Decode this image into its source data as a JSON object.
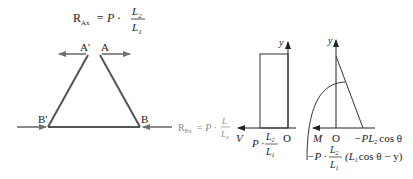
{
  "diagram": {
    "frame": {
      "top_formula": {
        "lhs": "R",
        "lhs_sub": "Ax",
        "eq": "= P ·",
        "num": "L",
        "num_sub": "2",
        "den": "L",
        "den_sub": "1"
      },
      "label_A_prime": "A'",
      "label_A": "A",
      "label_B_prime": "B'",
      "label_B": "B",
      "bottom_formula": {
        "lhs": "R",
        "lhs_sub": "Bx",
        "eq": "= P ·",
        "num": "L",
        "num_sub": "",
        "den": "L",
        "den_sub": "4"
      }
    },
    "shear_plot": {
      "y_axis": "y",
      "x_axis": "V",
      "origin": "O",
      "value_prefix": "P ·",
      "value_num": "L",
      "value_num_sub": "2",
      "value_den": "L",
      "value_den_sub": "1"
    },
    "moment_plot": {
      "y_axis": "y",
      "x_axis": "M",
      "origin": "O",
      "end_value": "−PL",
      "end_value_sub": "2",
      "end_value_tail": "cos θ",
      "curve_prefix": "−P ·",
      "curve_num": "L",
      "curve_num_sub": "2",
      "curve_den": "L",
      "curve_den_sub": "1",
      "curve_tail_a": "(L",
      "curve_tail_sub": "1",
      "curve_tail_b": "cos θ − y)"
    },
    "colors": {
      "line": "#555555",
      "arrow": "#6f6f6f",
      "text": "#222222",
      "faded_text": "#8a8a8a"
    }
  }
}
